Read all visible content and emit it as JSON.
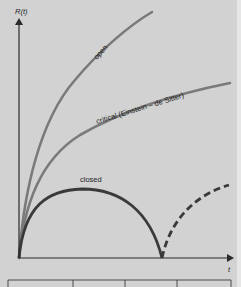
{
  "diagram": {
    "y_axis_label": "R(t)",
    "x_axis_label": "t",
    "colors": {
      "background": "#d2d2d2",
      "axis": "#2a2a2a",
      "open": "#7a7a7a",
      "critical": "#7a7a7a",
      "closed": "#3a3a3a",
      "closed_future": "#3a3a3a"
    },
    "curves": [
      {
        "id": "open",
        "label": "open",
        "style": "solid"
      },
      {
        "id": "critical",
        "label": "critical (Einstein – de Sitter)",
        "style": "solid"
      },
      {
        "id": "closed",
        "label": "closed",
        "style": "solid"
      },
      {
        "id": "closed-future",
        "label": "",
        "style": "dashed"
      }
    ],
    "footer_cells": 4
  }
}
